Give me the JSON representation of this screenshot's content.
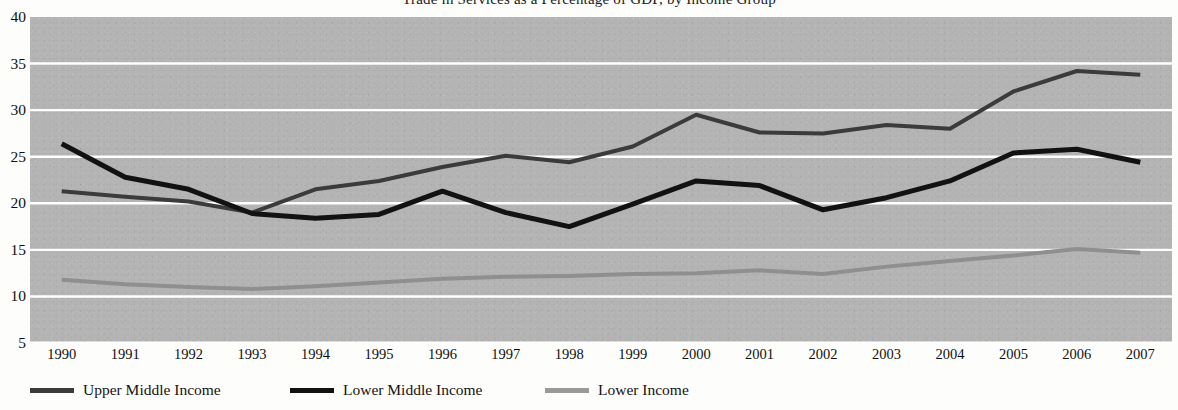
{
  "title": {
    "text": "Trade in Services as a Percentage of GDP, by Income Group",
    "clipped": true
  },
  "chart_data": {
    "type": "line",
    "title": "Trade in Services as a Percentage of GDP, by Income Group",
    "xlabel": "",
    "ylabel": "",
    "x": [
      1990,
      1991,
      1992,
      1993,
      1994,
      1995,
      1996,
      1997,
      1998,
      1999,
      2000,
      2001,
      2002,
      2003,
      2004,
      2005,
      2006,
      2007
    ],
    "categories": [
      "1990",
      "1991",
      "1992",
      "1993",
      "1994",
      "1995",
      "1996",
      "1997",
      "1998",
      "1999",
      "2000",
      "2001",
      "2002",
      "2003",
      "2004",
      "2005",
      "2006",
      "2007"
    ],
    "ylim": [
      5,
      40
    ],
    "yticks": [
      5,
      10,
      15,
      20,
      25,
      30,
      35,
      40
    ],
    "grid": true,
    "legend_position": "bottom-left",
    "plot_background": "#b4b4b4",
    "gridline_color": "#ffffff",
    "series": [
      {
        "name": "Upper Middle Income",
        "color": "#3b3b3b",
        "width": 4,
        "values": [
          21.3,
          20.7,
          20.2,
          19.0,
          21.5,
          22.4,
          23.9,
          25.1,
          24.4,
          26.1,
          29.5,
          27.6,
          27.5,
          28.4,
          28.0,
          32.0,
          34.2,
          33.8
        ]
      },
      {
        "name": "Lower Middle Income",
        "color": "#121212",
        "width": 5,
        "values": [
          26.4,
          22.8,
          21.5,
          18.9,
          18.4,
          18.8,
          21.3,
          19.0,
          17.5,
          19.9,
          22.4,
          21.9,
          19.3,
          20.6,
          22.4,
          25.4,
          25.8,
          24.4
        ]
      },
      {
        "name": "Lower Income",
        "color": "#8f8f8f",
        "width": 4,
        "values": [
          11.8,
          11.3,
          11.0,
          10.8,
          11.1,
          11.5,
          11.9,
          12.1,
          12.2,
          12.4,
          12.5,
          12.8,
          12.4,
          13.2,
          13.8,
          14.4,
          15.1,
          14.7
        ]
      }
    ]
  },
  "legend": {
    "items": [
      {
        "label": "Upper Middle Income",
        "color": "#3b3b3b",
        "left": 30
      },
      {
        "label": "Lower Middle Income",
        "color": "#121212",
        "left": 290
      },
      {
        "label": "Lower Income",
        "color": "#9a9a9a",
        "left": 545
      }
    ]
  }
}
